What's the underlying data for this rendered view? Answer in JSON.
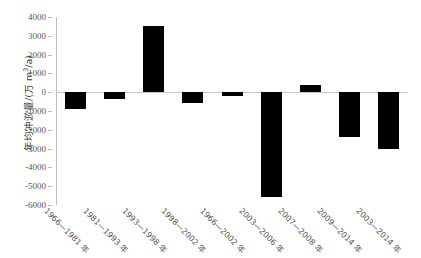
{
  "chart_data": {
    "type": "bar",
    "title": "",
    "xlabel": "",
    "ylabel": "年均冲淤量/(万 m³/a)",
    "ylabel_prefix": "年均冲淤量/(万 m",
    "ylabel_sup": "3",
    "ylabel_suffix": "/a)",
    "ylim": [
      -6000,
      4000
    ],
    "ytick_values": [
      4000,
      3000,
      2000,
      1000,
      0,
      -1000,
      -2000,
      -3000,
      -4000,
      -5000,
      -6000
    ],
    "ytick_labels": [
      "4000",
      "3000",
      "2000",
      "1000",
      "0",
      "-1000",
      "-2000",
      "-3000",
      "-4000",
      "-5000",
      "-6000"
    ],
    "grid": false,
    "legend": false,
    "bar_color": "#000000",
    "axis_color": "#bdbdbd",
    "categories": [
      "1966—1981 年",
      "1981—1993 年",
      "1993—1998 年",
      "1998—2002 年",
      "1966—2002 年",
      "2003—2006 年",
      "2007—2008 年",
      "2009—2014 年",
      "2003—2014 年"
    ],
    "values": [
      -900,
      -350,
      3500,
      -550,
      -200,
      -5600,
      400,
      -2400,
      -3000
    ]
  },
  "caption": ""
}
